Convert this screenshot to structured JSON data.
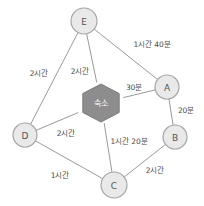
{
  "diagram": {
    "type": "weighted-undirected-graph",
    "colors": {
      "background": "#ffffff",
      "node_fill": "#e9e9e9",
      "node_stroke": "#a6a6a6",
      "hub_fill": "#8d8d8d",
      "edge_stroke": "#9a9a9a",
      "label_text": "#4a4a4a",
      "hub_text": "#ffffff"
    },
    "nodes": [
      {
        "id": "E",
        "label": "E",
        "shape": "circle",
        "cx": 84,
        "cy": 21,
        "r": 13
      },
      {
        "id": "A",
        "label": "A",
        "shape": "circle",
        "cx": 167,
        "cy": 87,
        "r": 12
      },
      {
        "id": "B",
        "label": "B",
        "shape": "circle",
        "cx": 175,
        "cy": 137,
        "r": 12
      },
      {
        "id": "C",
        "label": "C",
        "shape": "circle",
        "cx": 114,
        "cy": 185,
        "r": 13
      },
      {
        "id": "D",
        "label": "D",
        "shape": "circle",
        "cx": 25,
        "cy": 135,
        "r": 12
      },
      {
        "id": "HUB",
        "label": "숙소",
        "shape": "hexagon",
        "cx": 101,
        "cy": 103,
        "rx": 21,
        "ry": 19
      }
    ],
    "edges": [
      {
        "from": "E",
        "to": "A",
        "weight": "1시간 40분",
        "lx": 152,
        "ly": 45
      },
      {
        "from": "E",
        "to": "D",
        "weight": "2시간",
        "lx": 39,
        "ly": 74
      },
      {
        "from": "E",
        "to": "HUB",
        "weight": "2시간",
        "lx": 80,
        "ly": 72
      },
      {
        "from": "HUB",
        "to": "A",
        "weight": "30분",
        "lx": 134,
        "ly": 88
      },
      {
        "from": "A",
        "to": "B",
        "weight": "20분",
        "lx": 186,
        "ly": 111
      },
      {
        "from": "HUB",
        "to": "D",
        "weight": "2시간",
        "lx": 66,
        "ly": 134
      },
      {
        "from": "HUB",
        "to": "C",
        "weight": "1시간 20분",
        "lx": 129,
        "ly": 142
      },
      {
        "from": "D",
        "to": "C",
        "weight": "1시간",
        "lx": 60,
        "ly": 176
      },
      {
        "from": "C",
        "to": "B",
        "weight": "2시간",
        "lx": 155,
        "ly": 171
      }
    ]
  }
}
